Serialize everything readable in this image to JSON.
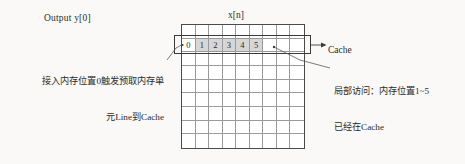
{
  "figure": {
    "output_label": "Output y[0]",
    "array_label": "x[n]",
    "cache_label": "Cache",
    "left_note_line1": "接入内存位置0触发预取内存单",
    "left_note_line2": "元Line到Cache",
    "right_note_line1": "局部访问：内存位置1~5",
    "right_note_line2": "已经在Cache"
  },
  "grid": {
    "columns": 9,
    "rows": 9,
    "cache_row_index": 1,
    "cell_labels": [
      "0",
      "1",
      "2",
      "3",
      "4",
      "5"
    ],
    "shaded_labels": [
      "1",
      "2",
      "3",
      "4",
      "5"
    ],
    "unshaded_labels": [
      "0"
    ]
  },
  "colors": {
    "background": "#faf9f7",
    "grid_line": "#9a9a9a",
    "grid_border": "#4a4a4a",
    "cache_border": "#3a3a3a",
    "shade": "#d6d6d6",
    "text": "#2b2b2b"
  },
  "icons": {
    "cache_pointer": "arrow-right-icon",
    "left_leader": "leader-line-icon",
    "right_leader": "leader-line-icon"
  }
}
